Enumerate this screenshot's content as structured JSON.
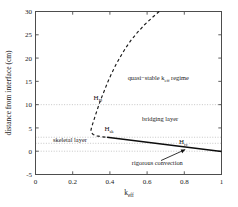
{
  "chart_data": {
    "type": "line",
    "title": "",
    "xlabel": "k_eff",
    "xlabel_base": "k",
    "xlabel_sub": "eff",
    "ylabel": "distance from interface (cm)",
    "xlim": [
      0,
      1
    ],
    "ylim": [
      -5,
      30
    ],
    "xticks": [
      0,
      0.2,
      0.4,
      0.6,
      0.8,
      1
    ],
    "xticklabels": [
      "0",
      "0.2",
      "0.4",
      "0.6",
      "0.8",
      "1"
    ],
    "yticks": [
      -5,
      0,
      5,
      10,
      15,
      20,
      25,
      30
    ],
    "yticklabels": [
      "-5",
      "0",
      "5",
      "10",
      "15",
      "20",
      "25",
      "30"
    ],
    "grid": "horizontal dotted reference lines only",
    "gridlines_y": [
      10,
      3,
      1.7,
      0
    ],
    "legend": "none",
    "series": [
      {
        "name": "quasi-stable boundary (dashed)",
        "style": "dashed",
        "points": [
          [
            0.665,
            30.0
          ],
          [
            0.625,
            28.6
          ],
          [
            0.585,
            27.1
          ],
          [
            0.548,
            25.5
          ],
          [
            0.513,
            23.8
          ],
          [
            0.482,
            22.0
          ],
          [
            0.455,
            20.2
          ],
          [
            0.43,
            18.4
          ],
          [
            0.408,
            16.6
          ],
          [
            0.388,
            14.8
          ],
          [
            0.37,
            13.0
          ],
          [
            0.352,
            11.2
          ],
          [
            0.336,
            9.4
          ],
          [
            0.322,
            7.7
          ],
          [
            0.31,
            6.2
          ],
          [
            0.302,
            5.2
          ],
          [
            0.298,
            4.5
          ],
          [
            0.3,
            4.0
          ],
          [
            0.31,
            3.6
          ],
          [
            0.33,
            3.3
          ],
          [
            0.355,
            3.1
          ],
          [
            0.385,
            3.0
          ]
        ]
      },
      {
        "name": "rigorous convection boundary (solid)",
        "style": "solid",
        "points": [
          [
            0.385,
            3.0
          ],
          [
            1.0,
            -0.05
          ]
        ]
      }
    ],
    "annotations": [
      {
        "name": "quasi-stable-regime-label",
        "base": "quasi−stable k",
        "sub": "eff",
        "tail": " regime",
        "x": 0.66,
        "y": 15.2
      },
      {
        "name": "bridging-layer-label",
        "base": "bridging layer",
        "sub": "",
        "tail": "",
        "x": 0.67,
        "y": 6.4
      },
      {
        "name": "skeletal-layer-label",
        "base": "skeletal layer",
        "sub": "",
        "tail": "",
        "x": 0.185,
        "y": 1.9
      },
      {
        "name": "rigorous-convection-label",
        "base": "rigorous convection",
        "sub": "",
        "tail": "",
        "x": 0.655,
        "y": -3.0
      },
      {
        "name": "h-d-label",
        "base": "H",
        "sub": "D",
        "tail": "",
        "x": 0.335,
        "y": 11.0
      },
      {
        "name": "h-sk-label",
        "base": "H",
        "sub": "sk",
        "tail": "",
        "x": 0.395,
        "y": 4.3
      },
      {
        "name": "h-rc-label",
        "base": "H",
        "sub": "rc",
        "tail": "",
        "x": 0.795,
        "y": 1.55
      }
    ],
    "arrow": {
      "name": "rigorous-convection-arrow",
      "from_x": 0.675,
      "from_y": -2.0,
      "to_x": 0.805,
      "to_y": 0.35
    },
    "colors": {
      "curve": "#1a1a1a",
      "grid": "#b9b9b9",
      "frame": "#4d4d4d",
      "background": "#ffffff"
    }
  }
}
